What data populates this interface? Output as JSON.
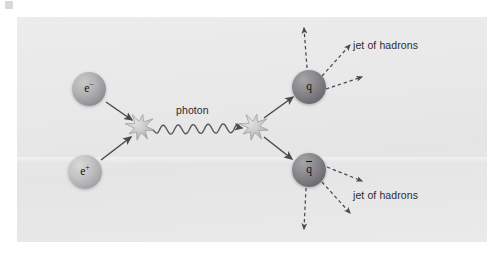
{
  "figure": {
    "panel_background": "#e8e8e9",
    "page_background": "#ffffff"
  },
  "labels": {
    "photon": "photon",
    "jet_top": "jet of hadrons",
    "jet_bottom": "jet of hadrons"
  },
  "particles": [
    {
      "id": "electron",
      "label": "e",
      "charge": "−",
      "name": "electron",
      "cx": 89,
      "cy": 89,
      "radius": 17,
      "color": "#96969a"
    },
    {
      "id": "positron",
      "label": "e",
      "charge": "+",
      "name": "positron",
      "cx": 85,
      "cy": 172,
      "radius": 17,
      "color": "#ababae"
    },
    {
      "id": "quark",
      "label": "q",
      "charge": "",
      "name": "quark",
      "cx": 309,
      "cy": 87,
      "radius": 17,
      "color": "#76767b"
    },
    {
      "id": "antiquark",
      "label": "q",
      "charge": "",
      "name": "antiquark",
      "cx": 309,
      "cy": 170,
      "radius": 17,
      "color": "#76767b"
    }
  ],
  "vertices": [
    {
      "id": "vertex-left",
      "name": "annihilation-vertex",
      "cx": 140,
      "cy": 127,
      "radius": 13,
      "color": "#c4c4c6"
    },
    {
      "id": "vertex-right",
      "name": "pair-production-vertex",
      "cx": 254,
      "cy": 127,
      "radius": 13,
      "color": "#c4c4c6"
    }
  ],
  "solid_arrows": [
    {
      "id": "electron-in",
      "name": "electron-incoming-arrow",
      "x1": 106,
      "y1": 102,
      "x2": 132,
      "y2": 120
    },
    {
      "id": "positron-in",
      "name": "positron-incoming-arrow",
      "x1": 101,
      "y1": 160,
      "x2": 131,
      "y2": 137
    },
    {
      "id": "quark-out",
      "name": "quark-outgoing-arrow",
      "x1": 264,
      "y1": 118,
      "x2": 293,
      "y2": 97
    },
    {
      "id": "antiquark-out",
      "name": "antiquark-outgoing-arrow",
      "x1": 264,
      "y1": 137,
      "x2": 292,
      "y2": 159
    }
  ],
  "photon_line": {
    "id": "photon-wave",
    "name": "photon-wavy-line",
    "x1": 152,
    "y1": 130,
    "x2": 242,
    "y2": 128,
    "wavelength": 15,
    "amplitude": 4.5,
    "color": "#58585c"
  },
  "jet_arrows": [
    {
      "id": "jet-q-up",
      "name": "hadron-jet-arrow",
      "x1": 307,
      "y1": 68,
      "x2": 304,
      "y2": 28
    },
    {
      "id": "jet-q-diag",
      "name": "hadron-jet-arrow",
      "x1": 322,
      "y1": 76,
      "x2": 350,
      "y2": 45
    },
    {
      "id": "jet-q-right",
      "name": "hadron-jet-arrow",
      "x1": 326,
      "y1": 89,
      "x2": 362,
      "y2": 77
    },
    {
      "id": "jet-qbar-right",
      "name": "hadron-jet-arrow",
      "x1": 327,
      "y1": 167,
      "x2": 362,
      "y2": 181
    },
    {
      "id": "jet-qbar-diag",
      "name": "hadron-jet-arrow",
      "x1": 322,
      "y1": 182,
      "x2": 350,
      "y2": 213
    },
    {
      "id": "jet-qbar-down",
      "name": "hadron-jet-arrow",
      "x1": 306,
      "y1": 188,
      "x2": 304,
      "y2": 229
    }
  ]
}
